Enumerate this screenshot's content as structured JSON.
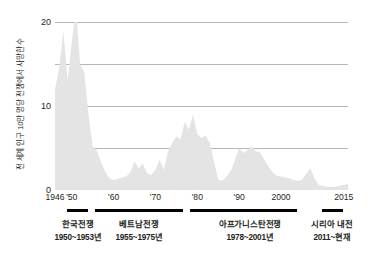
{
  "chart_data": {
    "type": "area",
    "title": "",
    "xlabel": "",
    "ylabel": "전 세계 인구 10만 명당 전쟁에서 사망한 수",
    "xlim": [
      1946,
      2016
    ],
    "ylim": [
      0,
      20
    ],
    "grid": true,
    "legend": "none",
    "fill_color": "#e4e4e4",
    "gridline_color": "#a7a9ac",
    "y_ticks": [
      0,
      10,
      20
    ],
    "y_tick_labels": [
      "0",
      "10",
      "20"
    ],
    "y_gridlines": [
      0,
      5,
      10,
      15,
      20
    ],
    "x_ticks": [
      1946,
      1950,
      1960,
      1970,
      1980,
      1990,
      2000,
      2015
    ],
    "x_tick_labels": [
      "1946",
      "'50",
      "'60",
      "'70",
      "'80",
      "'90",
      "2000",
      "2015"
    ],
    "x": [
      1946,
      1947,
      1948,
      1949,
      1950,
      1951,
      1952,
      1953,
      1954,
      1955,
      1956,
      1957,
      1958,
      1959,
      1960,
      1961,
      1962,
      1963,
      1964,
      1965,
      1966,
      1967,
      1968,
      1969,
      1970,
      1971,
      1972,
      1973,
      1974,
      1975,
      1976,
      1977,
      1978,
      1979,
      1980,
      1981,
      1982,
      1983,
      1984,
      1985,
      1986,
      1987,
      1988,
      1989,
      1990,
      1991,
      1992,
      1993,
      1994,
      1995,
      1996,
      1997,
      1998,
      1999,
      2000,
      2001,
      2002,
      2003,
      2004,
      2005,
      2006,
      2007,
      2008,
      2009,
      2010,
      2011,
      2012,
      2013,
      2014,
      2015,
      2016
    ],
    "values": [
      12.0,
      14.5,
      19.0,
      13.0,
      17.5,
      21.8,
      15.0,
      14.0,
      9.0,
      5.2,
      4.7,
      3.3,
      2.2,
      1.4,
      1.2,
      1.3,
      1.5,
      1.6,
      2.1,
      3.4,
      2.6,
      3.1,
      2.0,
      1.8,
      2.4,
      3.6,
      2.4,
      4.6,
      5.6,
      6.4,
      6.0,
      8.1,
      7.2,
      9.0,
      6.6,
      6.2,
      6.5,
      5.6,
      3.4,
      1.2,
      1.1,
      1.6,
      2.3,
      3.6,
      5.0,
      4.4,
      4.8,
      5.2,
      4.6,
      4.5,
      3.6,
      2.8,
      2.1,
      1.7,
      1.6,
      1.5,
      1.4,
      1.2,
      1.1,
      1.2,
      1.9,
      2.6,
      1.4,
      0.6,
      0.5,
      0.4,
      0.35,
      0.4,
      0.55,
      0.6,
      0.7
    ],
    "series_note": "전쟁 사망자 수 (인구 10만 명당)"
  },
  "annotations": [
    {
      "name": "한국전쟁",
      "years": "1950~1953년",
      "start": 1950,
      "end": 1953,
      "bar_left_px": 67,
      "bar_width_px": 21,
      "text_center_px": 78
    },
    {
      "name": "베트남전쟁",
      "years": "1955~1975년",
      "start": 1955,
      "end": 1975,
      "bar_left_px": 95,
      "bar_width_px": 88,
      "text_center_px": 139
    },
    {
      "name": "아프가니스탄전쟁",
      "years": "1978~2001년",
      "start": 1978,
      "end": 2001,
      "bar_left_px": 190,
      "bar_width_px": 107,
      "text_center_px": 250
    },
    {
      "name": "시리아 내전",
      "years": "2011~현재",
      "start": 2011,
      "end": 2016,
      "bar_left_px": 322,
      "bar_width_px": 21,
      "text_center_px": 332
    }
  ]
}
